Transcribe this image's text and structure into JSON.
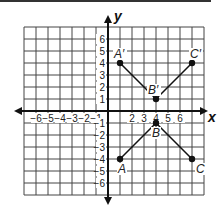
{
  "figure": {
    "axis_labels": {
      "x": "x",
      "y": "y"
    },
    "x_tick_labels": [
      "−6",
      "−5",
      "−4",
      "−3",
      "−2",
      "−1",
      "2",
      "3",
      "4",
      "5",
      "6"
    ],
    "y_tick_labels": [
      "6",
      "5",
      "4",
      "3",
      "2",
      "1",
      "−1",
      "−2",
      "−3",
      "−4",
      "−5",
      "−6"
    ],
    "grid": {
      "xmin": -7,
      "xmax": 8,
      "ymin": -7,
      "ymax": 7
    },
    "triangles": [
      {
        "name": "ABC",
        "points": [
          {
            "label": "A",
            "x": 1,
            "y": -4
          },
          {
            "label": "B",
            "x": 4,
            "y": -1
          },
          {
            "label": "C",
            "x": 7,
            "y": -4
          }
        ]
      },
      {
        "name": "A'B'C'",
        "points": [
          {
            "label": "A′",
            "x": 1,
            "y": 4
          },
          {
            "label": "B′",
            "x": 4,
            "y": 1
          },
          {
            "label": "C′",
            "x": 7,
            "y": 4
          }
        ]
      }
    ],
    "colors": {
      "grid": "#444444",
      "axis": "#111111",
      "point": "#111111"
    }
  }
}
